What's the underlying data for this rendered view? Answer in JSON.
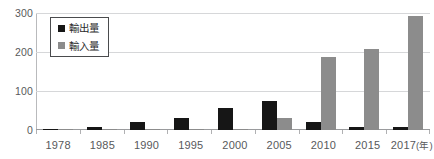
{
  "chart_data": {
    "type": "bar",
    "title": "",
    "xlabel": "年",
    "ylabel": "",
    "ylim": [
      0,
      300
    ],
    "yticks": [
      0,
      100,
      200,
      300
    ],
    "grid": true,
    "legend_position": "top-left",
    "categories": [
      "1978",
      "1985",
      "1990",
      "1995",
      "2000",
      "2005",
      "2010",
      "2015",
      "2017"
    ],
    "x_axis_unit_label": "(年)",
    "series": [
      {
        "name": "輸出量",
        "color": "#161616",
        "values": [
          3,
          9,
          20,
          32,
          56,
          74,
          20,
          8,
          7
        ]
      },
      {
        "name": "輸入量",
        "color": "#8c8c8c",
        "values": [
          1,
          1,
          2,
          2,
          3,
          31,
          187,
          208,
          292
        ]
      }
    ]
  },
  "axis": {
    "y_tick_labels": [
      "300",
      "200",
      "100",
      "0"
    ]
  },
  "legend": {
    "items": [
      {
        "label": "輸出量",
        "swatch": "export"
      },
      {
        "label": "輸入量",
        "swatch": "import"
      }
    ]
  },
  "colors": {
    "export_bar": "#161616",
    "import_bar": "#8c8c8c",
    "gridline": "#d6d7d9",
    "axis_line": "#b9babc",
    "tick_text": "#58595b",
    "legend_border": "#4a4b4d",
    "background": "#ffffff"
  }
}
